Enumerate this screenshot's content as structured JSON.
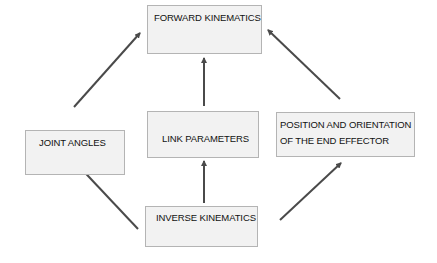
{
  "diagram": {
    "type": "flow",
    "colors": {
      "box_fill": "#f2f2f2",
      "box_border": "#b4b4b4",
      "arrow": "#4a4a4a",
      "text": "#111111"
    },
    "nodes": [
      {
        "id": "forward",
        "label": "FORWARD KINEMATICS"
      },
      {
        "id": "joint",
        "label": "JOINT ANGLES"
      },
      {
        "id": "link",
        "label": "LINK PARAMETERS"
      },
      {
        "id": "position",
        "label_line1": "POSITION AND ORIENTATION",
        "label_line2": "OF THE END EFFECTOR"
      },
      {
        "id": "inverse",
        "label": "INVERSE KINEMATICS"
      }
    ],
    "edges": [
      {
        "from": "joint",
        "to": "forward"
      },
      {
        "from": "link",
        "to": "forward"
      },
      {
        "from": "position",
        "to": "forward"
      },
      {
        "from": "inverse",
        "to": "joint"
      },
      {
        "from": "inverse",
        "to": "link"
      },
      {
        "from": "inverse",
        "to": "position"
      }
    ]
  }
}
